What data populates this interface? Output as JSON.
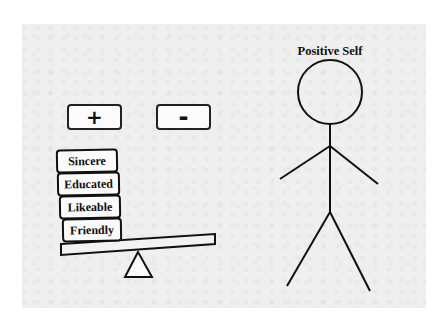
{
  "diagram": {
    "title": "Positive Self",
    "sign_buttons": [
      {
        "label": "+",
        "name": "plus"
      },
      {
        "label": "-",
        "name": "minus"
      }
    ],
    "traits": [
      "Sincere",
      "Educated",
      "Likeable",
      "Friendly"
    ],
    "elements": {
      "scale": "seesaw-balance",
      "figure": "stick-figure"
    },
    "colors": {
      "background": "#ffffff",
      "panel": "#efefef",
      "stroke": "#111111"
    }
  }
}
